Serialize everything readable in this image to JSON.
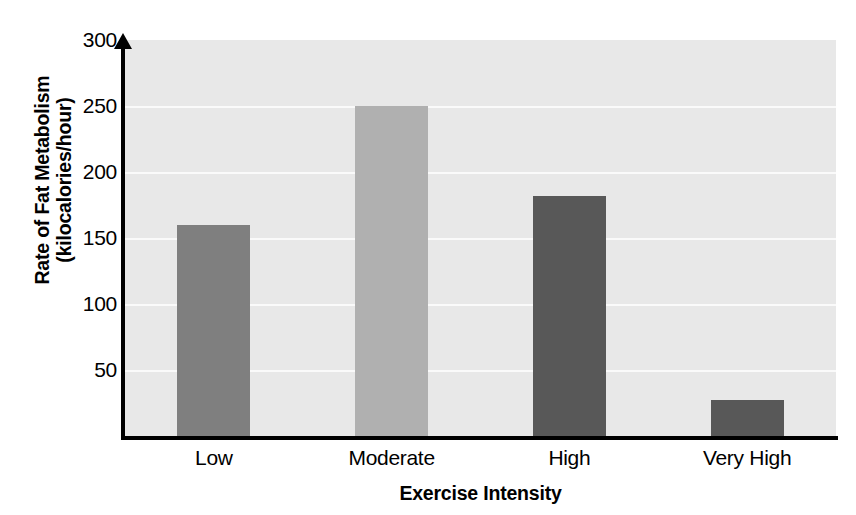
{
  "chart_data": {
    "type": "bar",
    "title": "",
    "xlabel": "Exercise Intensity",
    "ylabel": "Rate of Fat Metabolism (kilocalories/hour)",
    "ylabel_line1": "Rate of Fat Metabolism",
    "ylabel_line2": "(kilocalories/hour)",
    "categories": [
      "Low",
      "Moderate",
      "High",
      "Very High"
    ],
    "values": [
      160,
      250,
      182,
      27
    ],
    "bar_colors": [
      "#7f7f7f",
      "#b0b0b0",
      "#585858",
      "#585858"
    ],
    "ylim": [
      0,
      300
    ],
    "ytick_values": [
      50,
      100,
      150,
      200,
      250,
      300
    ],
    "ytick_labels": [
      "50",
      "100",
      "150",
      "200",
      "250",
      "300"
    ],
    "grid": true,
    "grid_color": "#fafafa",
    "plot_background": "#e8e8e8",
    "axis_color": "#000000",
    "legend": null,
    "legend_position": "none"
  }
}
